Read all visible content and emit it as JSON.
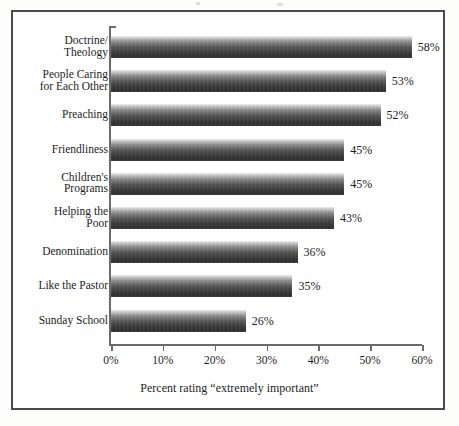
{
  "chart_data": {
    "type": "bar",
    "orientation": "horizontal",
    "title": "",
    "xlabel": "Percent rating “extremely important”",
    "ylabel": "",
    "xlim": [
      0,
      60
    ],
    "grid": false,
    "legend": null,
    "xtick_labels": [
      "0%",
      "10%",
      "20%",
      "30%",
      "40%",
      "50%",
      "60%"
    ],
    "xtick_values": [
      0,
      10,
      20,
      30,
      40,
      50,
      60
    ],
    "categories": [
      "Doctrine/\nTheology",
      "People Caring\nfor Each Other",
      "Preaching",
      "Friendliness",
      "Children's\nPrograms",
      "Helping the\nPoor",
      "Denomination",
      "Like the Pastor",
      "Sunday School"
    ],
    "values": [
      58,
      53,
      52,
      45,
      45,
      43,
      36,
      35,
      26
    ],
    "value_labels": [
      "58%",
      "53%",
      "52%",
      "45%",
      "45%",
      "43%",
      "36%",
      "35%",
      "26%"
    ],
    "bar_color_top": "#f2f2f2",
    "bar_color_bottom": "#2e2e2e",
    "axis_color": "#6b6b6b",
    "text_color": "#1d1d1d",
    "frame_color": "#4a4a4a"
  }
}
